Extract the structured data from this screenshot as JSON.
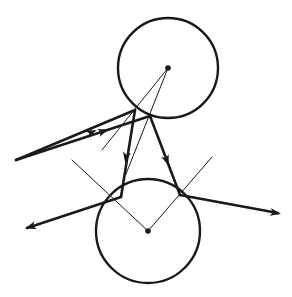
{
  "diagram": {
    "width": 292,
    "height": 297,
    "colors": {
      "background": "#ffffff",
      "stroke": "#1a1a1a"
    },
    "circles": [
      {
        "id": "top-sphere",
        "cx": 168,
        "cy": 68,
        "r": 50
      },
      {
        "id": "bottom-sphere",
        "cx": 148,
        "cy": 231,
        "r": 52
      }
    ],
    "center_dots": [
      {
        "id": "top-center",
        "cx": 168,
        "cy": 68
      },
      {
        "id": "bottom-center",
        "cx": 148,
        "cy": 231
      }
    ],
    "thick_rays": [
      {
        "id": "incoming-ray-1",
        "x1": 16,
        "y1": 160,
        "x2": 135,
        "y2": 110
      },
      {
        "id": "incoming-ray-2",
        "x1": 16,
        "y1": 160,
        "x2": 150,
        "y2": 116
      },
      {
        "id": "down-ray-left",
        "x1": 135,
        "y1": 110,
        "x2": 121,
        "y2": 197
      },
      {
        "id": "down-ray-right",
        "x1": 150,
        "y1": 116,
        "x2": 180,
        "y2": 195
      },
      {
        "id": "out-ray-left",
        "x1": 121,
        "y1": 197,
        "x2": 27,
        "y2": 228
      },
      {
        "id": "out-ray-right",
        "x1": 180,
        "y1": 195,
        "x2": 278,
        "y2": 213
      }
    ],
    "arrowheads": [
      {
        "id": "arrow-incoming-1",
        "x": 92,
        "y": 132,
        "angle": -22.8
      },
      {
        "id": "arrow-incoming-2",
        "x": 104,
        "y": 131,
        "angle": -18.2
      },
      {
        "id": "arrow-down-left",
        "x": 126,
        "y": 158,
        "angle": 99.1
      },
      {
        "id": "arrow-down-right",
        "x": 167,
        "y": 161,
        "angle": 69.2
      },
      {
        "id": "arrow-out-left",
        "x": 30,
        "y": 227,
        "angle": 161.7
      },
      {
        "id": "arrow-out-right",
        "x": 276,
        "y": 213,
        "angle": 10.4
      }
    ],
    "thin_lines": [
      {
        "id": "normal-top-1",
        "x1": 168,
        "y1": 68,
        "x2": 102,
        "y2": 150
      },
      {
        "id": "normal-top-2",
        "x1": 168,
        "y1": 68,
        "x2": 126,
        "y2": 174
      },
      {
        "id": "normal-bottom-left",
        "x1": 148,
        "y1": 231,
        "x2": 72,
        "y2": 160
      },
      {
        "id": "normal-bottom-right",
        "x1": 148,
        "y1": 231,
        "x2": 212,
        "y2": 157
      }
    ]
  }
}
